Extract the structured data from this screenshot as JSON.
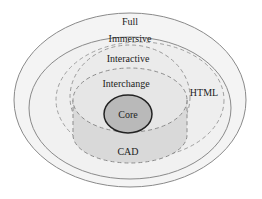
{
  "diagram": {
    "type": "nested-ellipse-venn",
    "regions": [
      {
        "id": "full",
        "label": "Full",
        "border": "solid",
        "fill": "#f4f4f4",
        "stroke": "#8a8a8a"
      },
      {
        "id": "immersive",
        "label": "Immersive",
        "border": "solid",
        "fill": "#f1f1f1",
        "stroke": "#8a8a8a"
      },
      {
        "id": "html",
        "label": "HTML",
        "border": "dashed",
        "fill": "#eeeeee",
        "stroke": "#9a9a9a"
      },
      {
        "id": "interactive",
        "label": "Interactive",
        "border": "dashed",
        "fill": "#ebebeb",
        "stroke": "#9a9a9a"
      },
      {
        "id": "interchange",
        "label": "Interchange",
        "border": "dashed",
        "fill": "#e6e6e6",
        "stroke": "#8c8c8c"
      },
      {
        "id": "cad",
        "label": "CAD",
        "border": "dashed",
        "fill": "#d9d9d9",
        "stroke": "#8c8c8c"
      },
      {
        "id": "core",
        "label": "Core",
        "border": "solid",
        "fill": "#b9b9b9",
        "stroke": "#222222"
      }
    ]
  }
}
